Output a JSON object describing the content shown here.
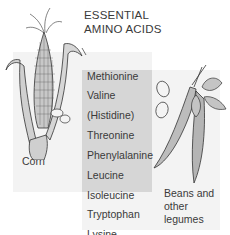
{
  "title": {
    "line1": "ESSENTIAL",
    "line2": "AMINO ACIDS"
  },
  "amino_acids": [
    {
      "name": "Methionine",
      "source": "corn"
    },
    {
      "name": "Valine",
      "source": "both"
    },
    {
      "name": "(Histidine)",
      "source": "both"
    },
    {
      "name": "Threonine",
      "source": "both"
    },
    {
      "name": "Phenylalanine",
      "source": "both"
    },
    {
      "name": "Leucine",
      "source": "both"
    },
    {
      "name": "Isoleucine",
      "source": "both"
    },
    {
      "name": "Tryptophan",
      "source": "beans"
    },
    {
      "name": "Lysine",
      "source": "beans"
    }
  ],
  "labels": {
    "corn": "Corn",
    "beans_line1": "Beans and",
    "beans_line2": "other",
    "beans_line3": "legumes"
  },
  "colors": {
    "corn_region": "#f3f3f3",
    "beans_region": "#f3f3f3",
    "overlap_region": "#d6d6d6",
    "text": "#3a3a3a"
  },
  "icons": {
    "corn": "corn-illustration",
    "beans": "bean-pod-illustration"
  }
}
